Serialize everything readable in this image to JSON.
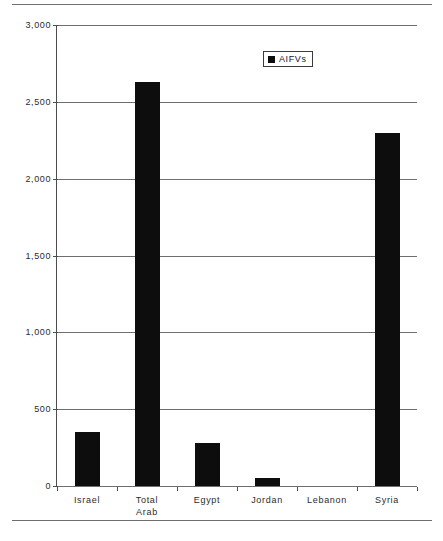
{
  "chart_data": {
    "type": "bar",
    "title": "",
    "xlabel": "",
    "ylabel": "",
    "categories": [
      "Israel",
      "Total Arab",
      "Egypt",
      "Jordan",
      "Lebanon",
      "Syria"
    ],
    "category_lines": [
      [
        "Israel"
      ],
      [
        "Total",
        "Arab"
      ],
      [
        "Egypt"
      ],
      [
        "Jordan"
      ],
      [
        "Lebanon"
      ],
      [
        "Syria"
      ]
    ],
    "series": [
      {
        "name": "AIFVs",
        "values": [
          350,
          2630,
          280,
          55,
          0,
          2300
        ],
        "color": "#0d0d0d"
      }
    ],
    "values": [
      350,
      2630,
      280,
      55,
      0,
      2300
    ],
    "ylim": [
      0,
      3000
    ],
    "ytick_values": [
      0,
      500,
      1000,
      1500,
      2000,
      2500,
      3000
    ],
    "ytick_labels": [
      "0",
      "500",
      "1,000",
      "1,500",
      "2,000",
      "2,500",
      "3,000"
    ],
    "grid": true,
    "legend_position": "top-right",
    "legend_entries": [
      {
        "label": "AIFVs",
        "marker": "filled-square",
        "color": "#0d0d0d"
      }
    ]
  },
  "legend": {
    "label": "AIFVs",
    "marker_name": "legend-swatch-square"
  },
  "colors": {
    "bar": "#0d0d0d",
    "gridline": "#6e6e6e",
    "axis": "#4d4d4d",
    "rule": "#6e6e6e",
    "text": "#2b2b2b",
    "background": "#ffffff"
  }
}
